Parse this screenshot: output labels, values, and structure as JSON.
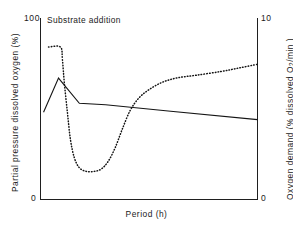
{
  "figure": {
    "annotation": "Substrate addition",
    "xlabel": "Period (h)",
    "ylabel_left": "Partial  pressure  dissolved  oxygen  (%)",
    "ylabel_right_pre": "Oxygen  demand  (%  dissolved  O",
    "ylabel_right_sub": "2",
    "ylabel_right_post": "/min )",
    "ytick_left_top": "100",
    "ytick_left_bottom": "0",
    "ytick_right_top": "10",
    "ytick_right_bottom": "0",
    "line_color": "#141414",
    "axis_color": "#1f1f1f"
  },
  "chart_data": {
    "type": "line",
    "title": "",
    "annotations": [
      {
        "text": "Substrate addition",
        "x": 0.04,
        "y": 0.97
      }
    ],
    "xlabel": "Period (h)",
    "ylabel": "Partial pressure dissolved oxygen (%)",
    "ylabel_secondary": "Oxygen demand (% dissolved O2/min)",
    "xlim": [
      0,
      10
    ],
    "ylim": [
      0,
      100
    ],
    "ylim_secondary": [
      0,
      10
    ],
    "yticks": [
      0,
      100
    ],
    "yticks_secondary": [
      0,
      10
    ],
    "xticks": [],
    "grid": false,
    "legend": "none",
    "series": [
      {
        "name": "Partial pressure dissolved oxygen (%)",
        "axis": "left",
        "style": "solid",
        "x": [
          0.14,
          0.83,
          1.79,
          3.0,
          4.27,
          6.0,
          10.0
        ],
        "y": [
          48.1,
          66.9,
          53.0,
          52.2,
          50.7,
          48.6,
          44.0
        ]
      },
      {
        "name": "Oxygen demand (% dissolved O2/min)",
        "axis": "right",
        "style": "dotted",
        "x": [
          0.37,
          0.92,
          1.01,
          1.1,
          1.24,
          1.38,
          1.56,
          1.79,
          2.11,
          2.48,
          2.8,
          3.12,
          3.44,
          3.76,
          4.13,
          4.54,
          5.0,
          5.6,
          6.3,
          7.2,
          8.3,
          9.17,
          10.0
        ],
        "y": [
          8.4,
          8.4,
          7.7,
          6.4,
          4.8,
          3.3,
          2.3,
          1.75,
          1.55,
          1.55,
          1.68,
          2.1,
          2.85,
          3.85,
          4.9,
          5.6,
          6.05,
          6.45,
          6.7,
          6.85,
          7.05,
          7.25,
          7.45
        ]
      }
    ]
  }
}
